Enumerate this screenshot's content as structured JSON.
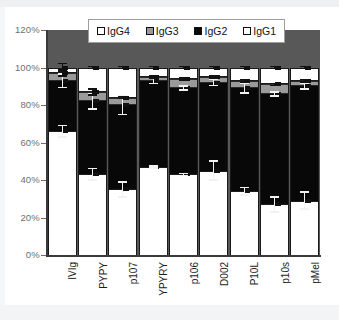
{
  "chart_data": {
    "type": "bar",
    "subtype": "stacked-bar-100pct-with-errorbars",
    "title": "",
    "xlabel": "",
    "ylabel": "",
    "ylim": [
      0,
      120
    ],
    "yticks": [
      "0%",
      "20%",
      "40%",
      "60%",
      "80%",
      "100%",
      "120%"
    ],
    "ytick_values": [
      0,
      20,
      40,
      60,
      80,
      100,
      120
    ],
    "grid": false,
    "legend_position": "top-center",
    "categories": [
      "IVIg",
      "PYPY",
      "p107",
      "YPYRY",
      "p106",
      "D002",
      "P10L",
      "p10s",
      "pMel"
    ],
    "series": [
      {
        "name": "IgG1",
        "color": "#ffffff",
        "values": [
          66,
          43,
          35,
          47,
          43,
          45,
          34,
          27,
          29
        ],
        "errors": [
          3.5,
          3.5,
          4.5,
          1.0,
          1.0,
          5.5,
          2.5,
          4.5,
          5.0
        ]
      },
      {
        "name": "IgG2",
        "color": "#080808",
        "values": [
          27,
          39,
          45,
          46,
          46,
          47,
          55,
          59,
          61
        ],
        "cumulative_tops": [
          93,
          82,
          80,
          93,
          89,
          92,
          89,
          86,
          90
        ],
        "errors": [
          4.0,
          4.5,
          5.5,
          2.0,
          1.5,
          2.0,
          3.0,
          1.5,
          2.0
        ]
      },
      {
        "name": "IgG3",
        "color": "#9a9a9a",
        "values": [
          4,
          5,
          4,
          2,
          5,
          3,
          4,
          5,
          3
        ],
        "cumulative_tops": [
          97,
          87,
          84,
          95,
          94,
          95,
          93,
          91,
          93
        ],
        "errors": [
          2.0,
          2.0,
          1.0,
          1.0,
          1.0,
          1.0,
          1.0,
          1.0,
          1.0
        ]
      },
      {
        "name": "IgG4",
        "color": "#ffffff",
        "values": [
          3,
          13,
          16,
          5,
          6,
          5,
          7,
          9,
          7
        ],
        "cumulative_tops": [
          100,
          100,
          100,
          100,
          100,
          100,
          100,
          100,
          100
        ],
        "errors": [
          2.5,
          1.0,
          1.0,
          1.0,
          1.0,
          1.0,
          1.0,
          1.0,
          1.0
        ]
      }
    ],
    "legend": [
      {
        "label": "IgG4",
        "swatch": "white"
      },
      {
        "label": "IgG3",
        "swatch": "gray"
      },
      {
        "label": "IgG2",
        "swatch": "black"
      },
      {
        "label": "IgG1",
        "swatch": "white"
      }
    ],
    "colors": {
      "plot_background": "#585858",
      "page_background": "#ffffff",
      "axis": "#3a3a3a",
      "tick_label": "#6f6f6f",
      "category_label": "#1d1d1d"
    }
  }
}
